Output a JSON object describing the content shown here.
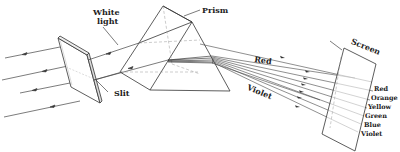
{
  "diagram": {
    "labels": {
      "white_light_line1": "White",
      "white_light_line2": "light",
      "prism": "Prism",
      "slit": "Slit",
      "screen": "Screen",
      "red_beam": "Red",
      "violet_beam": "Violet"
    },
    "spectrum": [
      {
        "name": "Red",
        "color": "#222222"
      },
      {
        "name": "Orange",
        "color": "#222222"
      },
      {
        "name": "Yellow",
        "color": "#222222"
      },
      {
        "name": "Green",
        "color": "#222222"
      },
      {
        "name": "Blue",
        "color": "#222222"
      },
      {
        "name": "Violet",
        "color": "#222222"
      }
    ],
    "colors": {
      "line": "#333333",
      "dashed": "#999999",
      "background": "#ffffff"
    }
  }
}
